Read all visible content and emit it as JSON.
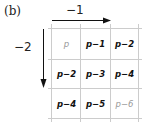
{
  "panel_label": "(b)",
  "horizontal_step": "−1",
  "vertical_step": "−2",
  "grid": {
    "rows": [
      [
        {
          "text": "p",
          "style": "light"
        },
        {
          "text": "p−1",
          "style": "bold"
        },
        {
          "text": "p−2",
          "style": "bold"
        }
      ],
      [
        {
          "text": "p−2",
          "style": "bold"
        },
        {
          "text": "p−3",
          "style": "bold"
        },
        {
          "text": "p−4",
          "style": "bold"
        }
      ],
      [
        {
          "text": "p−4",
          "style": "bold"
        },
        {
          "text": "p−5",
          "style": "bold"
        },
        {
          "text": "p−6",
          "style": "light"
        }
      ]
    ]
  },
  "colors": {
    "grid_line": "#cccccc",
    "arrow": "#111111",
    "light_text": "#999999"
  }
}
